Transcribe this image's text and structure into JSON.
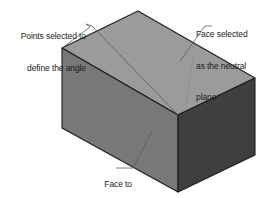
{
  "diagram": {
    "background_color": "#ffffff",
    "shape": {
      "name": "rectangular-block",
      "faces": {
        "top": {
          "label": "neutral plane face",
          "fill": "#9b9b9b",
          "stroke": "#1d1d1d"
        },
        "front_left": {
          "label": "face to be drafted",
          "fill": "#787878",
          "stroke": "#1d1d1d"
        },
        "right": {
          "label": "side face",
          "fill": "#3f3f3f",
          "stroke": "#1d1d1d"
        }
      }
    },
    "leader_color": "#5a5a5a"
  },
  "callouts": {
    "points": {
      "name": "points-selected-callout",
      "lines": [
        "Points selected to",
        "define the angle"
      ]
    },
    "neutral_plane": {
      "name": "neutral-plane-callout",
      "lines": [
        "Face selected",
        "as the neutral",
        "plane"
      ]
    },
    "drafted_face": {
      "name": "face-to-be-drafted-callout",
      "lines": [
        "Face to",
        "be drafted"
      ]
    }
  }
}
